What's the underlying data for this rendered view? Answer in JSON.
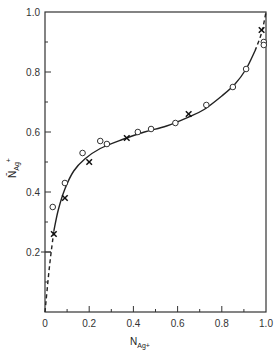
{
  "chart_data": {
    "type": "scatter",
    "title": "",
    "xlabel": "N_Ag+",
    "ylabel": "N̄_Ag+",
    "xlim": [
      0,
      1.0
    ],
    "ylim": [
      0,
      1.0
    ],
    "grid": false,
    "legend": null,
    "x_ticks": [
      "0",
      "0.2",
      "0.4",
      "0.6",
      "0.8",
      "1.0"
    ],
    "y_ticks": [
      "0.2",
      "0.4",
      "0.6",
      "0.8",
      "1.0"
    ],
    "series": [
      {
        "name": "circles",
        "marker": "o",
        "points": [
          [
            0.035,
            0.35
          ],
          [
            0.09,
            0.43
          ],
          [
            0.17,
            0.53
          ],
          [
            0.25,
            0.57
          ],
          [
            0.28,
            0.56
          ],
          [
            0.42,
            0.6
          ],
          [
            0.48,
            0.61
          ],
          [
            0.59,
            0.63
          ],
          [
            0.73,
            0.69
          ],
          [
            0.85,
            0.75
          ],
          [
            0.91,
            0.81
          ],
          [
            0.99,
            0.9
          ],
          [
            0.99,
            0.89
          ]
        ]
      },
      {
        "name": "crosses",
        "marker": "x",
        "points": [
          [
            0.04,
            0.26
          ],
          [
            0.09,
            0.38
          ],
          [
            0.2,
            0.5
          ],
          [
            0.37,
            0.58
          ],
          [
            0.65,
            0.66
          ],
          [
            0.98,
            0.94
          ]
        ]
      },
      {
        "name": "fitted curve",
        "style": "solid line, dashed at ends",
        "points": [
          [
            0.0,
            0.0
          ],
          [
            0.02,
            0.15
          ],
          [
            0.04,
            0.27
          ],
          [
            0.06,
            0.34
          ],
          [
            0.09,
            0.41
          ],
          [
            0.13,
            0.47
          ],
          [
            0.18,
            0.51
          ],
          [
            0.25,
            0.545
          ],
          [
            0.35,
            0.575
          ],
          [
            0.45,
            0.6
          ],
          [
            0.55,
            0.62
          ],
          [
            0.65,
            0.65
          ],
          [
            0.72,
            0.675
          ],
          [
            0.8,
            0.72
          ],
          [
            0.86,
            0.76
          ],
          [
            0.91,
            0.81
          ],
          [
            0.95,
            0.87
          ],
          [
            0.98,
            0.93
          ],
          [
            1.0,
            1.0
          ]
        ]
      }
    ]
  },
  "labels": {
    "x_axis": "N",
    "x_axis_sub": "Ag+",
    "y_axis": "N̄",
    "y_axis_sub": "Ag",
    "y_axis_sup": "+"
  }
}
